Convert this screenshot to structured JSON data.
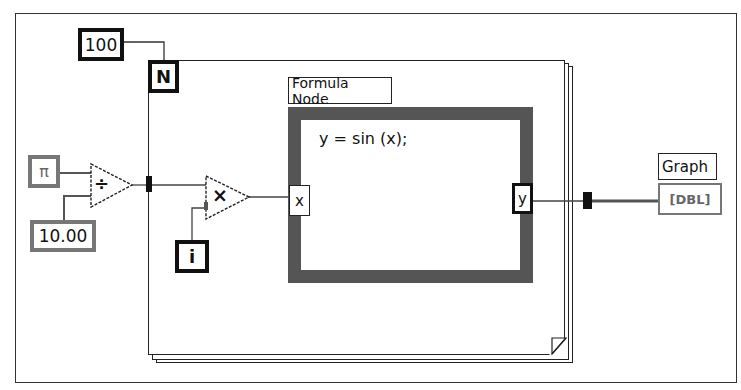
{
  "diagram": {
    "type": "LabVIEW block diagram",
    "constants": {
      "loop_count": "100",
      "pi": "π",
      "divisor": "10.00"
    },
    "for_loop": {
      "count_terminal": "N",
      "iteration_terminal": "i"
    },
    "functions": {
      "divide_symbol": "÷",
      "multiply_symbol": "×"
    },
    "formula_node": {
      "label": "Formula Node",
      "formula": "y = sin (x);",
      "input_var": "x",
      "output_var": "y"
    },
    "indicator": {
      "label": "Graph",
      "type_badge": "[DBL]"
    },
    "colors": {
      "frame": "#333333",
      "formula_node_border": "#555555",
      "wire": "#444444",
      "dbl_indicator": "#777777"
    }
  }
}
